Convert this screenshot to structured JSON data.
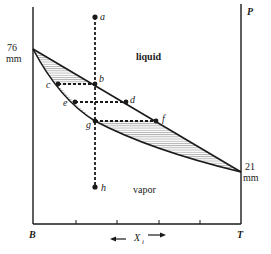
{
  "diagram": {
    "type": "vapor-liquid phase diagram (pressure vs composition)",
    "axis_labels": {
      "left_bottom": "B",
      "right_bottom": "T",
      "right_top": "P",
      "x_axis": "X",
      "x_axis_subscript": "i"
    },
    "endpoint_labels": {
      "left_value": "76",
      "left_unit": "mm",
      "right_value": "21",
      "right_unit": "mm"
    },
    "regions": {
      "upper": "liquid",
      "lower": "vapor"
    },
    "points": [
      {
        "id": "a",
        "label": "a"
      },
      {
        "id": "b",
        "label": "b"
      },
      {
        "id": "c",
        "label": "c"
      },
      {
        "id": "d",
        "label": "d"
      },
      {
        "id": "e",
        "label": "e"
      },
      {
        "id": "f",
        "label": "f"
      },
      {
        "id": "g",
        "label": "g"
      },
      {
        "id": "h",
        "label": "h"
      }
    ],
    "colors": {
      "line": "#1a1a1a",
      "hatch": "#8a8a8a",
      "background": "#ffffff"
    }
  }
}
